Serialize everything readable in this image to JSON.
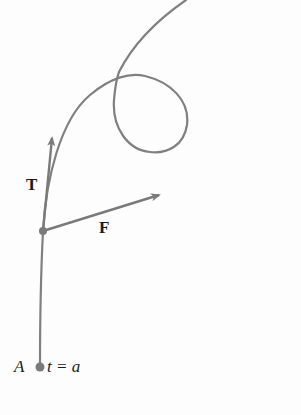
{
  "figure": {
    "labels": {
      "tangent": "T",
      "force": "F",
      "start_point": "A",
      "parameter": "t = a"
    },
    "colors": {
      "curve": "#808080",
      "vectors": "#7a7a7a",
      "text": "#1a1a1a",
      "background": "#fdfdfd"
    }
  }
}
